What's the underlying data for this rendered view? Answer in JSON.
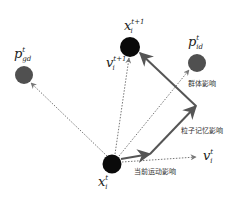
{
  "diagram": {
    "type": "particle-swarm-velocity-update",
    "nodes": {
      "x_current": {
        "label": "x",
        "sup": "t",
        "sub": "i",
        "color": "#0a0a0a"
      },
      "x_next": {
        "label": "x",
        "sup": "t+1",
        "sub": "i",
        "color": "#0a0a0a"
      },
      "p_gd": {
        "label": "p",
        "sup": "t",
        "sub": "gd",
        "color": "#505050"
      },
      "p_id": {
        "label": "p",
        "sup": "t",
        "sub": "id",
        "color": "#505050"
      }
    },
    "vectors": {
      "v_current": {
        "label": "v",
        "sup": "t",
        "sub": "i"
      },
      "v_next": {
        "label": "v",
        "sup": "t+1",
        "sub": "i"
      }
    },
    "annotations": {
      "group_influence": "群体影响",
      "memory_influence": "粒子记忆影响",
      "motion_influence": "当前运动影响"
    },
    "colors": {
      "solid_arrow": "#555555",
      "dotted_arrow": "#777777"
    }
  }
}
